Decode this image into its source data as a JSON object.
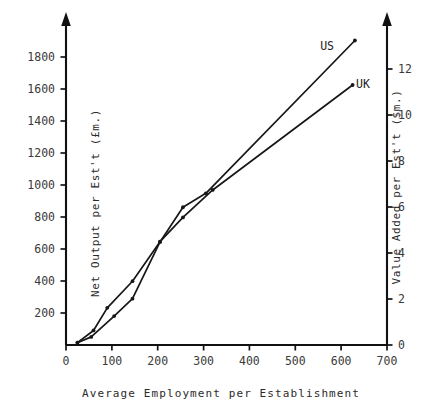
{
  "chart_data": {
    "type": "line",
    "title": "",
    "xlabel": "Average Employment per Establishment",
    "ylabel_left": "Net Output per Est't (£m.)",
    "ylabel_right": "Value Added per Est't ($m.)",
    "xlim": [
      0,
      700
    ],
    "ylim_left": [
      0,
      2000
    ],
    "ylim_right": [
      0,
      13.95
    ],
    "xticks": [
      0,
      100,
      200,
      300,
      400,
      500,
      600,
      700
    ],
    "xticklabels": [
      "0",
      "100",
      "200",
      "300",
      "400",
      "500",
      "600",
      "700"
    ],
    "yticks_left": [
      200,
      400,
      600,
      800,
      1000,
      1200,
      1400,
      1600,
      1800
    ],
    "yticklabels_left": [
      "200",
      "400",
      "600",
      "800",
      "1000",
      "1200",
      "1400",
      "1600",
      "1800"
    ],
    "yticks_right": [
      0,
      2,
      4,
      6,
      8,
      10,
      12
    ],
    "yticklabels_right": [
      "0",
      "2",
      "4",
      "6",
      "8",
      "10",
      "12"
    ],
    "grid": false,
    "legend_position": "inline-end-of-line",
    "series": [
      {
        "name": "US",
        "label": "US",
        "axis": "right",
        "x": [
          25,
          55,
          105,
          145,
          205,
          255,
          305,
          630
        ],
        "y": [
          0.1,
          0.35,
          1.25,
          2.0,
          4.45,
          5.95,
          6.55,
          13.15
        ],
        "y_left_equivalent": [
          15,
          50,
          180,
          285,
          640,
          855,
          940,
          1885
        ]
      },
      {
        "name": "UK",
        "label": "UK",
        "axis": "left",
        "x": [
          25,
          60,
          90,
          145,
          205,
          255,
          320,
          625
        ],
        "y": [
          15,
          90,
          230,
          395,
          640,
          790,
          960,
          1610
        ],
        "y_right_equivalent": [
          0.1,
          0.6,
          1.6,
          2.75,
          4.45,
          5.5,
          6.7,
          11.25
        ]
      }
    ],
    "annotations": [
      {
        "text": "US",
        "x": 600,
        "y_left": 1930
      },
      {
        "text": "UK",
        "x": 590,
        "y_left": 1650
      }
    ]
  }
}
